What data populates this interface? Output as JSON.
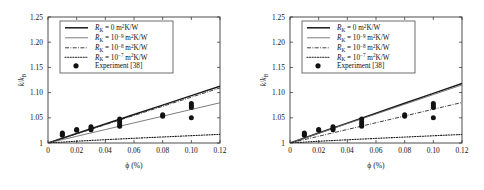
{
  "figure": {
    "panel_count": 2,
    "background_color": "#ffffff"
  },
  "axes": {
    "xlabel": "ϕ (%)",
    "ylabel_num": "k",
    "ylabel_den": "k",
    "ylabel_den_sub": "B",
    "xticks": [
      "0",
      "0.02",
      "0.04",
      "0.06",
      "0.08",
      "0.10",
      "0.12"
    ],
    "xtick_values": [
      0,
      0.02,
      0.04,
      0.06,
      0.08,
      0.1,
      0.12
    ],
    "yticks": [
      "1",
      "1.05",
      "1.10",
      "1.15",
      "1.20",
      "1.25"
    ],
    "ytick_values": [
      1,
      1.05,
      1.1,
      1.15,
      1.2,
      1.25
    ],
    "xlim": [
      0,
      0.12
    ],
    "ylim": [
      1,
      1.25
    ]
  },
  "legend": {
    "position": "upper-left",
    "entries": [
      {
        "symbol": "R",
        "symbol_sub": "K",
        "eq": "= 0 m",
        "exp_unit": "2",
        "unit_tail": "K/W",
        "style": "solid-thick"
      },
      {
        "symbol": "R",
        "symbol_sub": "K",
        "eq": "= 10",
        "exp": "−9",
        "tail": " m",
        "exp_unit": "2",
        "unit_tail": "K/W",
        "style": "solid-thin"
      },
      {
        "symbol": "R",
        "symbol_sub": "K",
        "eq": "= 10",
        "exp": "−8",
        "tail": " m",
        "exp_unit": "2",
        "unit_tail": "K/W",
        "style": "dashdot"
      },
      {
        "symbol": "R",
        "symbol_sub": "K",
        "eq": "= 10",
        "exp": "−7",
        "tail": " m",
        "exp_unit": "2",
        "unit_tail": "K/W",
        "style": "dotted"
      },
      {
        "label": "Experiment [38]",
        "style": "marker"
      }
    ]
  },
  "chart_data": [
    {
      "type": "line",
      "panel": "left",
      "title": "",
      "xlabel": "ϕ (%)",
      "ylabel": "k/k_B",
      "xlim": [
        0,
        0.12
      ],
      "ylim": [
        1,
        1.25
      ],
      "grid": false,
      "legend_position": "upper left",
      "series": [
        {
          "name": "R_K = 0 m2K/W",
          "style": "solid-thick",
          "x": [
            0,
            0.02,
            0.04,
            0.06,
            0.08,
            0.1,
            0.12
          ],
          "values": [
            1.0,
            1.0188,
            1.0376,
            1.0564,
            1.0752,
            1.094,
            1.1128
          ]
        },
        {
          "name": "R_K = 1e-9 m2K/W",
          "style": "solid-thin",
          "x": [
            0,
            0.02,
            0.04,
            0.06,
            0.08,
            0.1,
            0.12
          ],
          "values": [
            1.0,
            1.0133,
            1.0266,
            1.0399,
            1.0532,
            1.0665,
            1.0798
          ]
        },
        {
          "name": "R_K = 1e-8 m2K/W",
          "style": "dashdot",
          "x": [
            0,
            0.02,
            0.04,
            0.06,
            0.08,
            0.1,
            0.12
          ],
          "values": [
            1.0,
            1.0182,
            1.0364,
            1.0546,
            1.0728,
            1.091,
            1.1092
          ]
        },
        {
          "name": "R_K = 1e-7 m2K/W",
          "style": "dotted",
          "x": [
            0,
            0.02,
            0.04,
            0.06,
            0.08,
            0.1,
            0.12
          ],
          "values": [
            1.0,
            1.0036,
            1.0066,
            1.0094,
            1.012,
            1.0146,
            1.0172
          ]
        }
      ],
      "scatter": {
        "name": "Experiment [38]",
        "marker": "filled-circle",
        "points": [
          {
            "x": 0.01,
            "y": 1.0155
          },
          {
            "x": 0.01,
            "y": 1.0178
          },
          {
            "x": 0.01,
            "y": 1.0198
          },
          {
            "x": 0.02,
            "y": 1.0252
          },
          {
            "x": 0.02,
            "y": 1.0268
          },
          {
            "x": 0.03,
            "y": 1.0262
          },
          {
            "x": 0.03,
            "y": 1.0292
          },
          {
            "x": 0.03,
            "y": 1.0322
          },
          {
            "x": 0.05,
            "y": 1.033
          },
          {
            "x": 0.05,
            "y": 1.0378
          },
          {
            "x": 0.05,
            "y": 1.042
          },
          {
            "x": 0.05,
            "y": 1.0475
          },
          {
            "x": 0.08,
            "y": 1.0532
          },
          {
            "x": 0.08,
            "y": 1.0562
          },
          {
            "x": 0.1,
            "y": 1.05
          },
          {
            "x": 0.1,
            "y": 1.0706
          },
          {
            "x": 0.1,
            "y": 1.0745
          },
          {
            "x": 0.1,
            "y": 1.0782
          }
        ]
      }
    },
    {
      "type": "line",
      "panel": "right",
      "title": "",
      "xlabel": "ϕ (%)",
      "ylabel": "k/k_B",
      "xlim": [
        0,
        0.12
      ],
      "ylim": [
        1,
        1.25
      ],
      "grid": false,
      "legend_position": "upper left",
      "series": [
        {
          "name": "R_K = 0 m2K/W",
          "style": "solid-thick",
          "x": [
            0,
            0.02,
            0.04,
            0.06,
            0.08,
            0.1,
            0.12
          ],
          "values": [
            1.0,
            1.0197,
            1.0394,
            1.0591,
            1.0788,
            1.0985,
            1.1182
          ]
        },
        {
          "name": "R_K = 1e-9 m2K/W",
          "style": "solid-thin",
          "x": [
            0,
            0.02,
            0.04,
            0.06,
            0.08,
            0.1,
            0.12
          ],
          "values": [
            1.0,
            1.0192,
            1.0384,
            1.0576,
            1.0768,
            1.096,
            1.1152
          ]
        },
        {
          "name": "R_K = 1e-8 m2K/W",
          "style": "dashdot",
          "x": [
            0,
            0.02,
            0.04,
            0.06,
            0.08,
            0.1,
            0.12
          ],
          "values": [
            1.0,
            1.0134,
            1.0268,
            1.0402,
            1.0536,
            1.067,
            1.0804
          ]
        },
        {
          "name": "R_K = 1e-7 m2K/W",
          "style": "dotted",
          "x": [
            0,
            0.02,
            0.04,
            0.06,
            0.08,
            0.1,
            0.12
          ],
          "values": [
            1.0,
            1.0035,
            1.0064,
            1.0092,
            1.0118,
            1.0144,
            1.017
          ]
        }
      ],
      "scatter": {
        "name": "Experiment [38]",
        "marker": "filled-circle",
        "points": [
          {
            "x": 0.01,
            "y": 1.0155
          },
          {
            "x": 0.01,
            "y": 1.0178
          },
          {
            "x": 0.01,
            "y": 1.0198
          },
          {
            "x": 0.02,
            "y": 1.0252
          },
          {
            "x": 0.02,
            "y": 1.0268
          },
          {
            "x": 0.03,
            "y": 1.0262
          },
          {
            "x": 0.03,
            "y": 1.0292
          },
          {
            "x": 0.03,
            "y": 1.0322
          },
          {
            "x": 0.05,
            "y": 1.033
          },
          {
            "x": 0.05,
            "y": 1.0378
          },
          {
            "x": 0.05,
            "y": 1.042
          },
          {
            "x": 0.05,
            "y": 1.0475
          },
          {
            "x": 0.08,
            "y": 1.0532
          },
          {
            "x": 0.08,
            "y": 1.0562
          },
          {
            "x": 0.1,
            "y": 1.05
          },
          {
            "x": 0.1,
            "y": 1.0706
          },
          {
            "x": 0.1,
            "y": 1.0745
          },
          {
            "x": 0.1,
            "y": 1.0782
          }
        ]
      }
    }
  ]
}
